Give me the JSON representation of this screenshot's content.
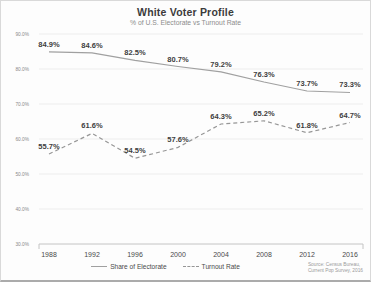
{
  "chart_data": {
    "type": "line",
    "title": "White Voter Profile",
    "subtitle": "% of U.S. Electorate vs Turnout Rate",
    "categories": [
      "1988",
      "1992",
      "1996",
      "2000",
      "2004",
      "2008",
      "2012",
      "2016"
    ],
    "series": [
      {
        "name": "Share of Electorate",
        "style": "solid",
        "values": [
          84.9,
          84.6,
          82.5,
          80.7,
          79.2,
          76.3,
          73.7,
          73.3
        ]
      },
      {
        "name": "Turnout Rate",
        "style": "dashed",
        "values": [
          55.7,
          61.6,
          54.5,
          57.6,
          64.3,
          65.2,
          61.8,
          64.7
        ]
      }
    ],
    "ylim": [
      30,
      90
    ],
    "ytick_labels": [
      "90.0%",
      "80.0%",
      "70.0%",
      "60.0%",
      "50.0%",
      "40.0%",
      "30.0%"
    ],
    "grid": true,
    "legend_position": "bottom",
    "data_labels": true,
    "colors": {
      "line_solid": "#a0a0a0",
      "line_dashed": "#969696",
      "data_label": "#3d3d3d",
      "axis_label": "#4a4a4a",
      "ytick_label": "#8a8a8a",
      "gridline": "#ededed",
      "axis_line": "#c4c4c4"
    },
    "source_line1": "Source: Census Bureau,",
    "source_line2": "Current Pop Survey, 2016"
  }
}
